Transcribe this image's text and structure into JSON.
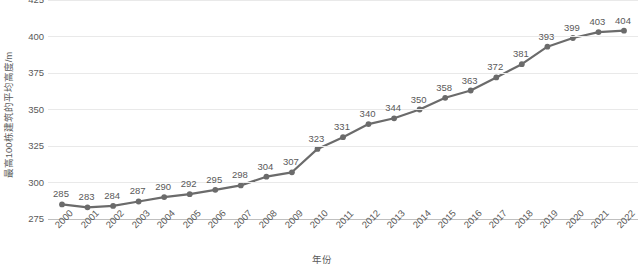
{
  "chart_data": {
    "type": "line",
    "title": "",
    "subtitle": "",
    "xlabel": "年份",
    "ylabel": "最高100栋建筑的平均高度/m",
    "categories": [
      "2000",
      "2001",
      "2002",
      "2003",
      "2004",
      "2005",
      "2006",
      "2007",
      "2008",
      "2009",
      "2010",
      "2011",
      "2012",
      "2013",
      "2014",
      "2015",
      "2016",
      "2017",
      "2018",
      "2019",
      "2020",
      "2021",
      "2022"
    ],
    "values": [
      285,
      283,
      284,
      287,
      290,
      292,
      295,
      298,
      304,
      307,
      323,
      331,
      340,
      344,
      350,
      358,
      363,
      372,
      381,
      393,
      399,
      403,
      404
    ],
    "ylim": [
      275,
      425
    ],
    "yticks": [
      "275",
      "300",
      "325",
      "350",
      "375",
      "400",
      "425"
    ],
    "ytick_values": [
      275,
      300,
      325,
      350,
      375,
      400,
      425
    ],
    "grid": true,
    "legend": "none",
    "data_labels": true,
    "series": [
      {
        "name": "最高100栋建筑的平均高度/m",
        "values": [
          285,
          283,
          284,
          287,
          290,
          292,
          295,
          298,
          304,
          307,
          323,
          331,
          340,
          344,
          350,
          358,
          363,
          372,
          381,
          393,
          399,
          403,
          404
        ]
      }
    ],
    "colors": {
      "line": "#6b6b6b",
      "marker": "#6b6b6b",
      "gridline": "#e9e9e9",
      "axis": "#bfbfbf",
      "text": "#595959",
      "background": "#ffffff"
    }
  }
}
